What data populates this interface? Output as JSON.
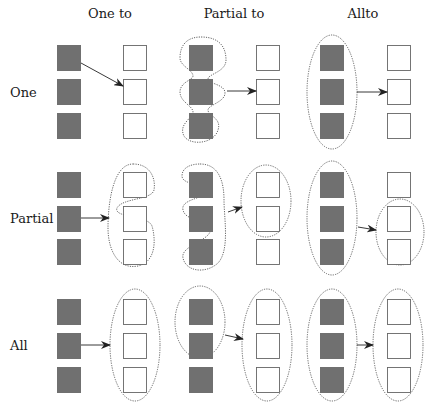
{
  "column_headers": [
    "One to",
    "Partial to",
    "Allto"
  ],
  "row_headers": [
    "One",
    "Partial",
    "All"
  ],
  "colors": {
    "source_fill": "#707070",
    "target_fill": "#ffffff",
    "stroke": "#555555",
    "arrow": "#222222",
    "text": "#1a1a1a"
  },
  "grid": {
    "rows": 3,
    "cols": 3,
    "tiles_per_group": 3,
    "cells": [
      {
        "row": "One",
        "col": "One to",
        "source_selection": [
          1
        ],
        "target_selection": [
          2
        ],
        "source_grouping": "single",
        "target_grouping": "single"
      },
      {
        "row": "One",
        "col": "Partial to",
        "source_selection": [
          1,
          2,
          3
        ],
        "target_selection": [
          2
        ],
        "source_grouping": "partial-outline",
        "target_grouping": "single"
      },
      {
        "row": "One",
        "col": "Allto",
        "source_selection": [
          1,
          2,
          3
        ],
        "target_selection": [
          2
        ],
        "source_grouping": "all-ellipse",
        "target_grouping": "single"
      },
      {
        "row": "Partial",
        "col": "One to",
        "source_selection": [
          2
        ],
        "target_selection": [
          1,
          2,
          3
        ],
        "source_grouping": "single",
        "target_grouping": "partial-outline"
      },
      {
        "row": "Partial",
        "col": "Partial to",
        "source_selection": [
          1,
          2,
          3
        ],
        "target_selection": [
          1,
          2
        ],
        "source_grouping": "partial-outline",
        "target_grouping": "ellipse"
      },
      {
        "row": "Partial",
        "col": "Allto",
        "source_selection": [
          1,
          2,
          3
        ],
        "target_selection": [
          2,
          3
        ],
        "source_grouping": "all-ellipse",
        "target_grouping": "ellipse"
      },
      {
        "row": "All",
        "col": "One to",
        "source_selection": [
          2
        ],
        "target_selection": [
          1,
          2,
          3
        ],
        "source_grouping": "single",
        "target_grouping": "all-ellipse"
      },
      {
        "row": "All",
        "col": "Partial to",
        "source_selection": [
          1,
          2
        ],
        "target_selection": [
          1,
          2,
          3
        ],
        "source_grouping": "ellipse",
        "target_grouping": "all-ellipse"
      },
      {
        "row": "All",
        "col": "Allto",
        "source_selection": [
          1,
          2,
          3
        ],
        "target_selection": [
          1,
          2,
          3
        ],
        "source_grouping": "all-ellipse",
        "target_grouping": "all-ellipse"
      }
    ]
  }
}
